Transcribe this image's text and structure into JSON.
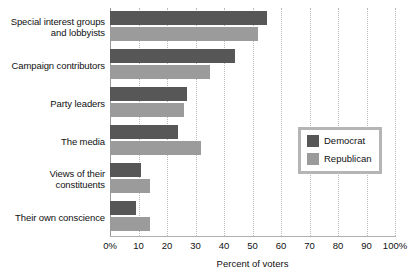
{
  "chart_data": {
    "type": "bar",
    "orientation": "horizontal",
    "title": "",
    "xlabel": "Percent of voters",
    "ylabel": "",
    "xlim": [
      0,
      100
    ],
    "xticks": [
      0,
      10,
      20,
      30,
      40,
      50,
      60,
      70,
      80,
      90,
      100
    ],
    "xticklabels": [
      "0%",
      "10",
      "20",
      "30",
      "40",
      "50",
      "60",
      "70",
      "80",
      "90",
      "100%"
    ],
    "grid": true,
    "grid_axis": "x",
    "legend_position": "center-right",
    "categories": [
      "Special interest groups and lobbyists",
      "Campaign contributors",
      "Party leaders",
      "The media",
      "Views of their constituents",
      "Their own conscience"
    ],
    "category_lines": [
      [
        "Special interest groups",
        "and lobbyists"
      ],
      [
        "Campaign contributors"
      ],
      [
        "Party leaders"
      ],
      [
        "The media"
      ],
      [
        "Views of their",
        "constituents"
      ],
      [
        "Their own conscience"
      ]
    ],
    "series": [
      {
        "name": "Democrat",
        "color": "#575757",
        "values": [
          55,
          44,
          27,
          24,
          11,
          9
        ]
      },
      {
        "name": "Republican",
        "color": "#9b9b9b",
        "values": [
          52,
          35,
          26,
          32,
          14,
          14
        ]
      }
    ]
  },
  "legend": {
    "items": [
      {
        "label": "Democrat",
        "color": "#575757"
      },
      {
        "label": "Republican",
        "color": "#9b9b9b"
      }
    ]
  },
  "axis": {
    "x_title": "Percent of voters"
  }
}
